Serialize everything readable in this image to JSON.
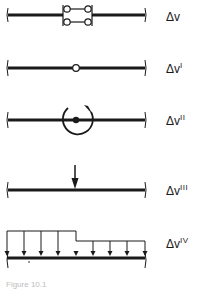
{
  "diagram": {
    "type": "beam load/discontinuity cases",
    "beam": {
      "x_start": 8,
      "x_end": 145,
      "color": "#1a1a1a"
    },
    "rows": [
      {
        "id": "sliding-link",
        "beam_y": 15,
        "symbol": "sliding link (double-link release)",
        "label_base": "Δv",
        "label_sup": ""
      },
      {
        "id": "hinge",
        "beam_y": 68,
        "symbol": "hinge (open circle)",
        "label_base": "Δv",
        "label_sup": "I"
      },
      {
        "id": "moment",
        "beam_y": 120,
        "symbol": "concentrated moment (curved arrow)",
        "label_base": "Δv",
        "label_sup": "II"
      },
      {
        "id": "point-load",
        "beam_y": 190,
        "symbol": "concentrated force (down arrow)",
        "label_base": "Δv",
        "label_sup": "III"
      },
      {
        "id": "distributed-load",
        "beam_y": 258,
        "symbol": "step distributed load (down arrows)",
        "label_base": "Δv",
        "label_sup": "IV"
      }
    ]
  },
  "caption": "Figure 10.1"
}
